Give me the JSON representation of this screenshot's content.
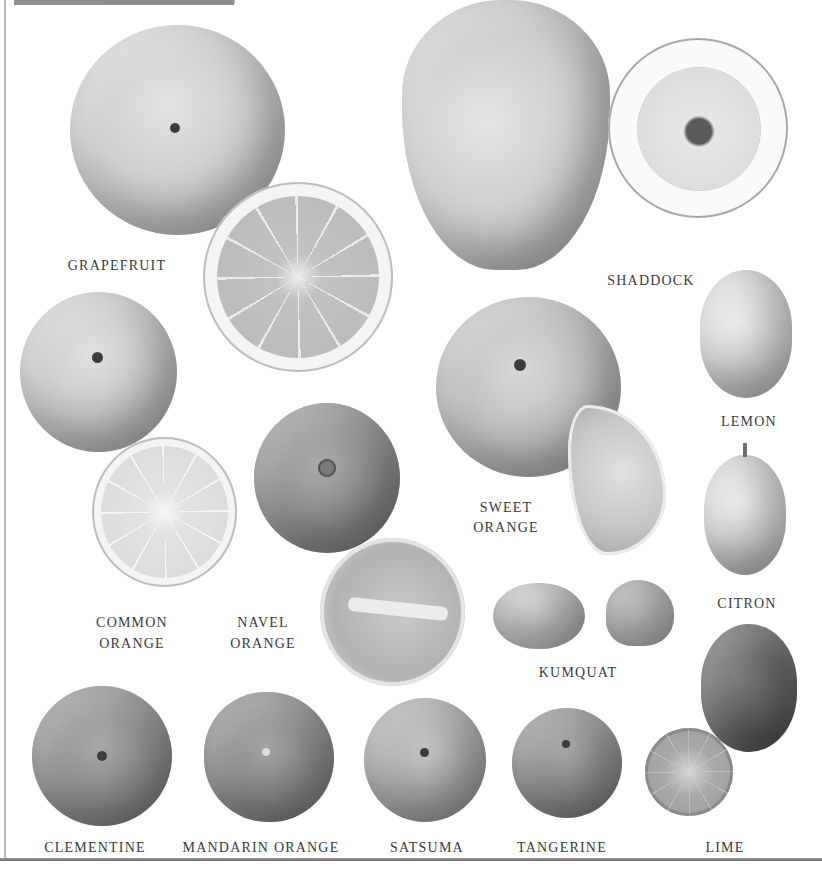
{
  "plate": {
    "title": "",
    "background": "#ffffff",
    "label_color": "#3a3a3a"
  },
  "labels": {
    "grapefruit": "GRAPEFRUIT",
    "shaddock": "SHADDOCK",
    "lemon": "LEMON",
    "sweet_orange_1": "SWEET",
    "sweet_orange_2": "ORANGE",
    "citron": "CITRON",
    "common_orange_1": "COMMON",
    "common_orange_2": "ORANGE",
    "navel_orange_1": "NAVEL",
    "navel_orange_2": "ORANGE",
    "kumquat": "KUMQUAT",
    "clementine": "CLEMENTINE",
    "mandarin_orange": "MANDARIN ORANGE",
    "satsuma": "SATSUMA",
    "tangerine": "TANGERINE",
    "lime": "LIME"
  },
  "fruits": [
    {
      "name": "Grapefruit",
      "views": [
        "whole",
        "half"
      ]
    },
    {
      "name": "Shaddock",
      "views": [
        "whole",
        "half"
      ]
    },
    {
      "name": "Lemon",
      "views": [
        "whole"
      ]
    },
    {
      "name": "Sweet Orange",
      "views": [
        "whole",
        "segment"
      ]
    },
    {
      "name": "Citron",
      "views": [
        "whole"
      ]
    },
    {
      "name": "Common Orange",
      "views": [
        "whole",
        "half"
      ]
    },
    {
      "name": "Navel Orange",
      "views": [
        "whole",
        "cut"
      ]
    },
    {
      "name": "Kumquat",
      "views": [
        "whole",
        "half"
      ]
    },
    {
      "name": "Clementine",
      "views": [
        "whole"
      ]
    },
    {
      "name": "Mandarin Orange",
      "views": [
        "whole"
      ]
    },
    {
      "name": "Satsuma",
      "views": [
        "whole"
      ]
    },
    {
      "name": "Tangerine",
      "views": [
        "whole"
      ]
    },
    {
      "name": "Lime",
      "views": [
        "whole",
        "half"
      ]
    }
  ]
}
